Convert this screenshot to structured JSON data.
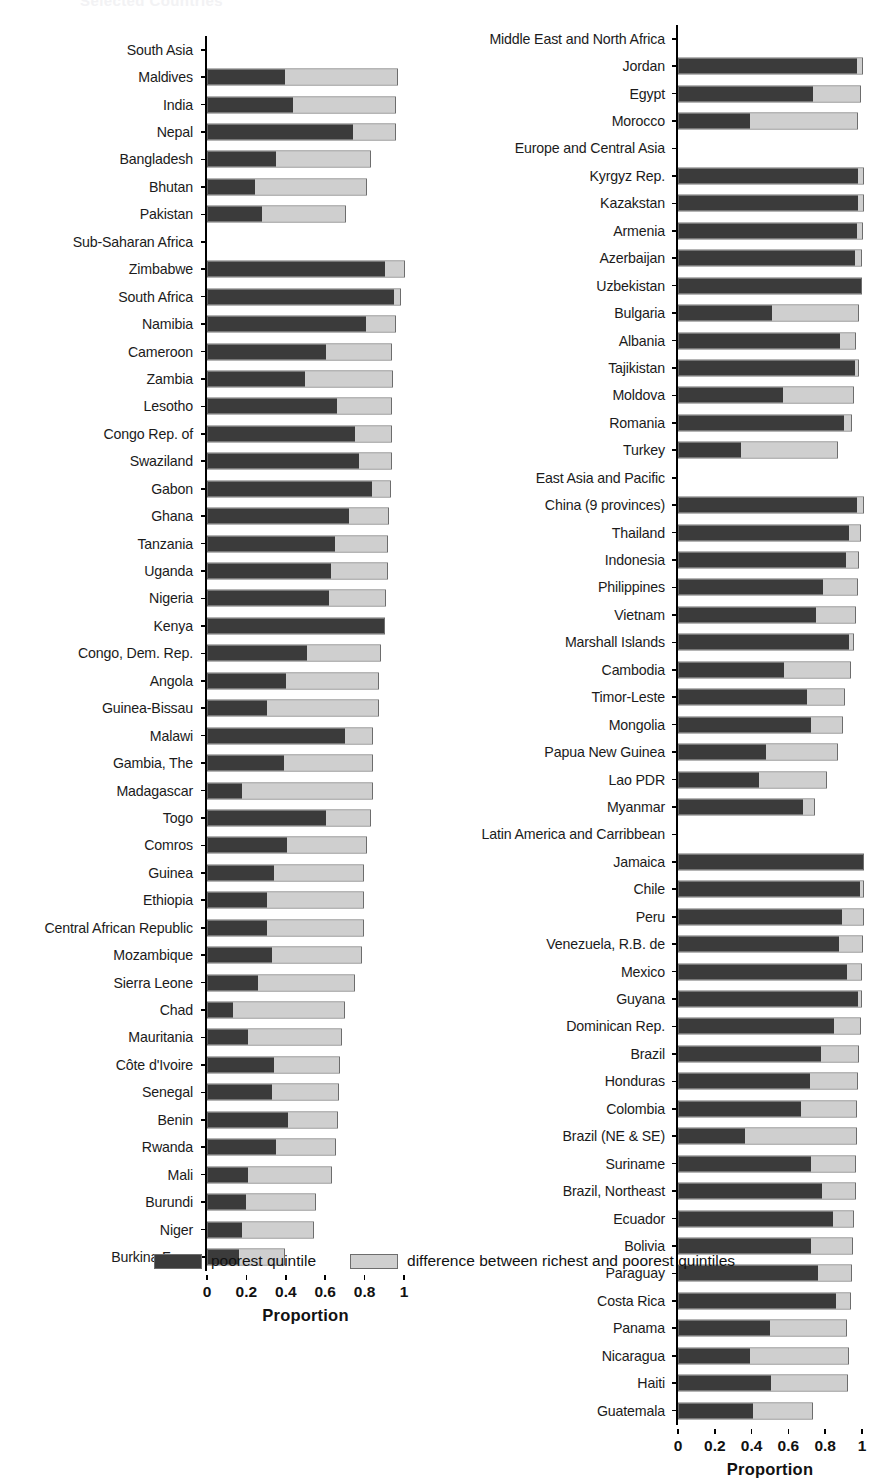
{
  "faint_title": "Selected Countries",
  "axis": {
    "ticks": [
      "0",
      "0.2",
      "0.4",
      "0.6",
      "0.8",
      "1"
    ],
    "tick_values": [
      0,
      0.2,
      0.4,
      0.6,
      0.8,
      1
    ],
    "title": "Proportion",
    "range": [
      0,
      1
    ]
  },
  "legend": {
    "items": [
      {
        "label": "poorest quintile",
        "color": "#3b3b3b"
      },
      {
        "label": "difference between richest and poorest quintiles",
        "color": "#cfcfcf"
      }
    ]
  },
  "chart_data": {
    "type": "bar",
    "orientation": "horizontal",
    "stacked": true,
    "title": "Selected Countries",
    "xlabel": "Proportion",
    "ylabel": "",
    "xlim": [
      0,
      1
    ],
    "grid": false,
    "legend_position": "bottom",
    "series": [
      {
        "name": "poorest quintile",
        "color": "#3b3b3b"
      },
      {
        "name": "difference between richest and poorest quintiles",
        "color": "#cfcfcf"
      }
    ],
    "panels": [
      {
        "panel": "left",
        "rows": [
          {
            "label": "South Asia",
            "group": true
          },
          {
            "label": "Maldives",
            "poorest": 0.39,
            "total": 0.96
          },
          {
            "label": "India",
            "poorest": 0.43,
            "total": 0.95
          },
          {
            "label": "Nepal",
            "poorest": 0.735,
            "total": 0.95
          },
          {
            "label": "Bangladesh",
            "poorest": 0.345,
            "total": 0.82
          },
          {
            "label": "Bhutan",
            "poorest": 0.24,
            "total": 0.8
          },
          {
            "label": "Pakistan",
            "poorest": 0.275,
            "total": 0.695
          },
          {
            "label": "Sub-Saharan Africa",
            "group": true
          },
          {
            "label": "Zimbabwe",
            "poorest": 0.9,
            "total": 0.995
          },
          {
            "label": "South Africa",
            "poorest": 0.945,
            "total": 0.975
          },
          {
            "label": "Namibia",
            "poorest": 0.8,
            "total": 0.95
          },
          {
            "label": "Cameroon",
            "poorest": 0.6,
            "total": 0.93
          },
          {
            "label": "Zambia",
            "poorest": 0.49,
            "total": 0.935
          },
          {
            "label": "Lesotho",
            "poorest": 0.655,
            "total": 0.93
          },
          {
            "label": "Congo Rep. of",
            "poorest": 0.745,
            "total": 0.93
          },
          {
            "label": "Swaziland",
            "poorest": 0.765,
            "total": 0.93
          },
          {
            "label": "Gabon",
            "poorest": 0.835,
            "total": 0.925
          },
          {
            "label": "Ghana",
            "poorest": 0.715,
            "total": 0.915
          },
          {
            "label": "Tanzania",
            "poorest": 0.645,
            "total": 0.91
          },
          {
            "label": "Uganda",
            "poorest": 0.625,
            "total": 0.91
          },
          {
            "label": "Nigeria",
            "poorest": 0.615,
            "total": 0.9
          },
          {
            "label": "Kenya",
            "poorest": 0.895,
            "total": 0.895
          },
          {
            "label": "Congo, Dem. Rep.",
            "poorest": 0.5,
            "total": 0.875
          },
          {
            "label": "Angola",
            "poorest": 0.395,
            "total": 0.865
          },
          {
            "label": "Guinea-Bissau",
            "poorest": 0.3,
            "total": 0.865
          },
          {
            "label": "Malawi",
            "poorest": 0.695,
            "total": 0.83
          },
          {
            "label": "Gambia, The",
            "poorest": 0.385,
            "total": 0.83
          },
          {
            "label": "Madagascar",
            "poorest": 0.175,
            "total": 0.83
          },
          {
            "label": "Togo",
            "poorest": 0.6,
            "total": 0.82
          },
          {
            "label": "Comros",
            "poorest": 0.4,
            "total": 0.8
          },
          {
            "label": "Guinea",
            "poorest": 0.335,
            "total": 0.785
          },
          {
            "label": "Ethiopia",
            "poorest": 0.3,
            "total": 0.785
          },
          {
            "label": "Central African Republic",
            "poorest": 0.3,
            "total": 0.785
          },
          {
            "label": "Mozambique",
            "poorest": 0.325,
            "total": 0.775
          },
          {
            "label": "Sierra Leone",
            "poorest": 0.255,
            "total": 0.74
          },
          {
            "label": "Chad",
            "poorest": 0.125,
            "total": 0.69
          },
          {
            "label": "Mauritania",
            "poorest": 0.205,
            "total": 0.675
          },
          {
            "label": "Côte d'Ivoire",
            "poorest": 0.335,
            "total": 0.665
          },
          {
            "label": "Senegal",
            "poorest": 0.325,
            "total": 0.66
          },
          {
            "label": "Benin",
            "poorest": 0.405,
            "total": 0.655
          },
          {
            "label": "Rwanda",
            "poorest": 0.345,
            "total": 0.645
          },
          {
            "label": "Mali",
            "poorest": 0.205,
            "total": 0.625
          },
          {
            "label": "Burundi",
            "poorest": 0.195,
            "total": 0.545
          },
          {
            "label": "Niger",
            "poorest": 0.175,
            "total": 0.535
          },
          {
            "label": "Burkina Faso",
            "poorest": 0.155,
            "total": 0.385
          }
        ]
      },
      {
        "panel": "right",
        "rows": [
          {
            "label": "Middle East and North Africa",
            "group": true
          },
          {
            "label": "Jordan",
            "poorest": 0.965,
            "total": 0.995
          },
          {
            "label": "Egypt",
            "poorest": 0.73,
            "total": 0.985
          },
          {
            "label": "Morocco",
            "poorest": 0.385,
            "total": 0.965
          },
          {
            "label": "Europe and Central Asia",
            "group": true
          },
          {
            "label": "Kyrgyz Rep.",
            "poorest": 0.975,
            "total": 1.0
          },
          {
            "label": "Kazakstan",
            "poorest": 0.975,
            "total": 1.0
          },
          {
            "label": "Armenia",
            "poorest": 0.965,
            "total": 0.995
          },
          {
            "label": "Azerbaijan",
            "poorest": 0.955,
            "total": 0.99
          },
          {
            "label": "Uzbekistan",
            "poorest": 0.99,
            "total": 0.99
          },
          {
            "label": "Bulgaria",
            "poorest": 0.505,
            "total": 0.975
          },
          {
            "label": "Albania",
            "poorest": 0.875,
            "total": 0.955
          },
          {
            "label": "Tajikistan",
            "poorest": 0.955,
            "total": 0.975
          },
          {
            "label": "Moldova",
            "poorest": 0.565,
            "total": 0.945
          },
          {
            "label": "Romania",
            "poorest": 0.895,
            "total": 0.935
          },
          {
            "label": "Turkey",
            "poorest": 0.335,
            "total": 0.86
          },
          {
            "label": "East Asia and Pacific",
            "group": true
          },
          {
            "label": "China (9 provinces)",
            "poorest": 0.97,
            "total": 1.0
          },
          {
            "label": "Thailand",
            "poorest": 0.925,
            "total": 0.985
          },
          {
            "label": "Indonesia",
            "poorest": 0.905,
            "total": 0.975
          },
          {
            "label": "Philippines",
            "poorest": 0.785,
            "total": 0.965
          },
          {
            "label": "Vietnam",
            "poorest": 0.745,
            "total": 0.955
          },
          {
            "label": "Marshall Islands",
            "poorest": 0.925,
            "total": 0.945
          },
          {
            "label": "Cambodia",
            "poorest": 0.57,
            "total": 0.93
          },
          {
            "label": "Timor-Leste",
            "poorest": 0.695,
            "total": 0.895
          },
          {
            "label": "Mongolia",
            "poorest": 0.72,
            "total": 0.885
          },
          {
            "label": "Papua New Guinea",
            "poorest": 0.475,
            "total": 0.86
          },
          {
            "label": "Lao PDR",
            "poorest": 0.435,
            "total": 0.8
          },
          {
            "label": "Myanmar",
            "poorest": 0.675,
            "total": 0.735
          },
          {
            "label": "Latin America and Carribbean",
            "group": true
          },
          {
            "label": "Jamaica",
            "poorest": 1.0,
            "total": 1.0
          },
          {
            "label": "Chile",
            "poorest": 0.985,
            "total": 1.0
          },
          {
            "label": "Peru",
            "poorest": 0.885,
            "total": 1.0
          },
          {
            "label": "Venezuela, R.B. de",
            "poorest": 0.87,
            "total": 0.995
          },
          {
            "label": "Mexico",
            "poorest": 0.915,
            "total": 0.99
          },
          {
            "label": "Guyana",
            "poorest": 0.975,
            "total": 0.99
          },
          {
            "label": "Dominican Rep.",
            "poorest": 0.845,
            "total": 0.985
          },
          {
            "label": "Brazil",
            "poorest": 0.77,
            "total": 0.975
          },
          {
            "label": "Honduras",
            "poorest": 0.71,
            "total": 0.965
          },
          {
            "label": "Colombia",
            "poorest": 0.665,
            "total": 0.96
          },
          {
            "label": "Brazil (NE & SE)",
            "poorest": 0.36,
            "total": 0.96
          },
          {
            "label": "Suriname",
            "poorest": 0.715,
            "total": 0.955
          },
          {
            "label": "Brazil, Northeast",
            "poorest": 0.775,
            "total": 0.955
          },
          {
            "label": "Ecuador",
            "poorest": 0.835,
            "total": 0.945
          },
          {
            "label": "Bolivia",
            "poorest": 0.715,
            "total": 0.94
          },
          {
            "label": "Paraguay",
            "poorest": 0.755,
            "total": 0.935
          },
          {
            "label": "Costa Rica",
            "poorest": 0.855,
            "total": 0.93
          },
          {
            "label": "Panama",
            "poorest": 0.495,
            "total": 0.91
          },
          {
            "label": "Nicaragua",
            "poorest": 0.385,
            "total": 0.92
          },
          {
            "label": "Haiti",
            "poorest": 0.5,
            "total": 0.915
          },
          {
            "label": "Guatemala",
            "poorest": 0.4,
            "total": 0.725
          }
        ]
      }
    ]
  }
}
